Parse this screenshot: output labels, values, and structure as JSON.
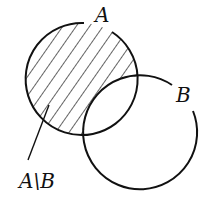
{
  "diagram": {
    "type": "venn",
    "sets": [
      {
        "name": "A",
        "label": "A",
        "cx": 81,
        "cy": 79,
        "r": 56
      },
      {
        "name": "B",
        "label": "B",
        "cx": 141,
        "cy": 133,
        "r": 57
      }
    ],
    "shaded_region": {
      "label": "A\\B",
      "description": "set difference A minus B (hatched)"
    },
    "colors": {
      "stroke": "#111111",
      "background": "#ffffff"
    }
  }
}
